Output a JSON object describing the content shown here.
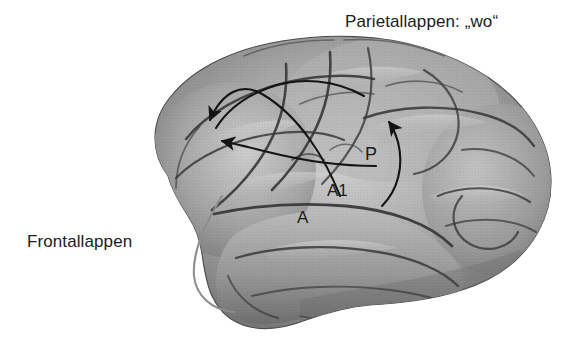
{
  "figure": {
    "title_visible": false,
    "background_color": "#ffffff",
    "ink_color": "#1b1b1b",
    "brain_base_color": "#9a9a9a",
    "brain_light_color": "#c8c8c8",
    "brain_dark_color": "#5e5e5e",
    "sulcus_color": "#3a3a3a",
    "pathway_color": "#141414",
    "secondary_pathway_color": "#8d8d8d"
  },
  "labels": {
    "parietal": "Parietallappen: „wo“",
    "frontal": "Frontallappen",
    "area_a": "A",
    "area_a1": "A1",
    "area_p": "P"
  },
  "annotations": {
    "arrows": [
      {
        "name": "arrow-a1-to-frontal-upper",
        "from": "A1",
        "to": "Frontallappen",
        "direction": "leftward-up",
        "color": "#141414",
        "head_at_x": 207,
        "head_at_y": 124
      },
      {
        "name": "arrow-p-to-frontal-lower",
        "from": "P",
        "to": "Frontallappen",
        "direction": "leftward",
        "color": "#141414",
        "head_at_x": 218,
        "head_at_y": 141
      },
      {
        "name": "arrow-p-to-parietal",
        "from": "P",
        "to": "Parietallappen",
        "direction": "upward",
        "color": "#141414",
        "head_at_x": 390,
        "head_at_y": 119
      }
    ],
    "curves": [
      {
        "name": "ventral-stream-curve",
        "color": "#8d8d8d",
        "description": "light gray curve descending from temporal region"
      }
    ]
  }
}
